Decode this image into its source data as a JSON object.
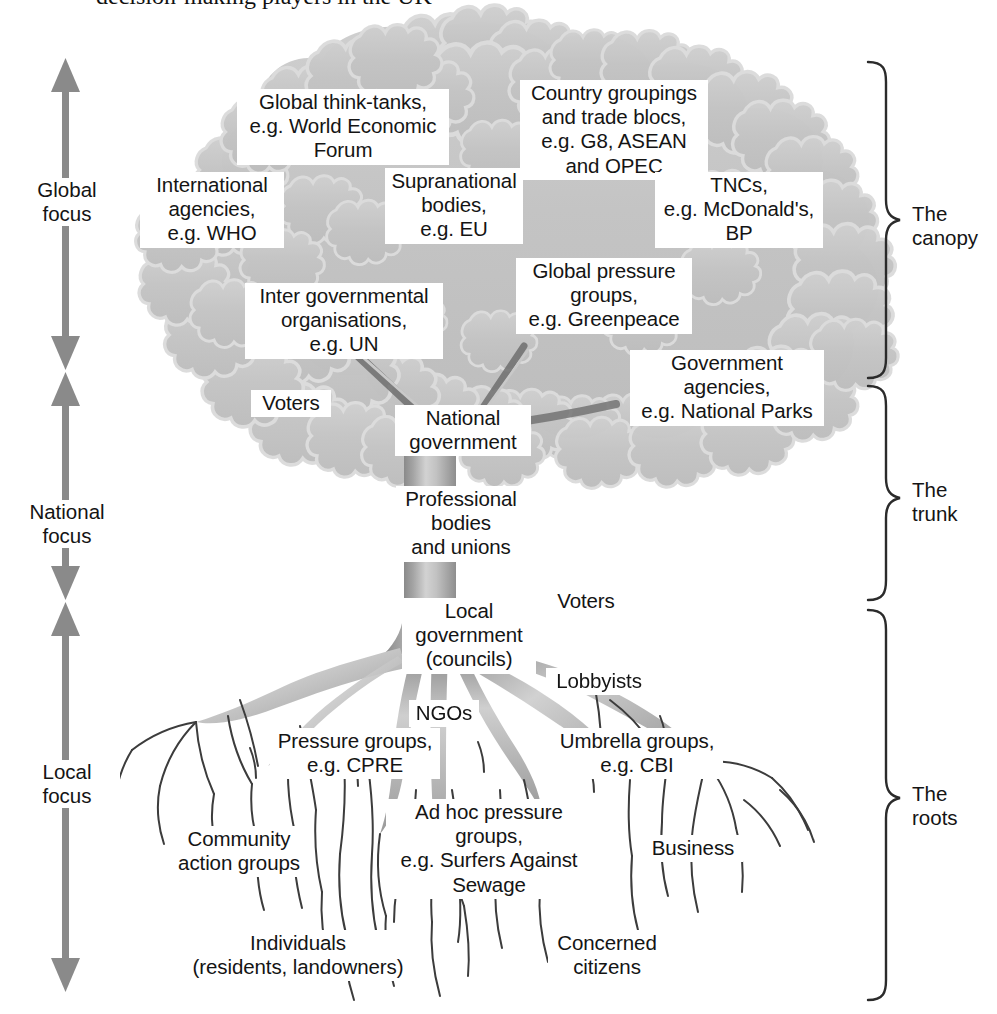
{
  "figure": {
    "title_fragment": "decision-making players in the UK",
    "type": "tree-diagram"
  },
  "colors": {
    "canopy_fill": "#c6c6c6",
    "canopy_edge": "#d8d8d8",
    "trunk_dark": "#8e8e8e",
    "trunk_light": "#d4d4d4",
    "root_line": "#3a3a3a",
    "arrow": "#8a8a8a",
    "bracket": "#2b2b2b",
    "text": "#141414",
    "label_bg": "#ffffff"
  },
  "axis": {
    "name": "focus-scale",
    "segments": [
      {
        "id": "global",
        "label": "Global\nfocus",
        "label_top": 178,
        "arrow_top": 60,
        "arrow_bottom": 370
      },
      {
        "id": "national",
        "label": "National\nfocus",
        "label_top": 500,
        "arrow_top": 372,
        "arrow_bottom": 600
      },
      {
        "id": "local",
        "label": "Local\nfocus",
        "label_top": 760,
        "arrow_top": 602,
        "arrow_bottom": 992
      }
    ]
  },
  "brackets": [
    {
      "id": "canopy",
      "label": "The\ncanopy",
      "top": 62,
      "bottom": 378,
      "label_top": 202
    },
    {
      "id": "trunk",
      "label": "The\ntrunk",
      "top": 386,
      "bottom": 600,
      "label_top": 478
    },
    {
      "id": "roots",
      "label": "The\nroots",
      "top": 610,
      "bottom": 1000,
      "label_top": 782
    }
  ],
  "canopy_labels": [
    {
      "id": "global-think-tanks",
      "text": "Global think-tanks,\ne.g. World Economic\nForum",
      "left": 237,
      "top": 89,
      "width": 204
    },
    {
      "id": "country-groupings",
      "text": "Country groupings\nand trade blocs,\ne.g. G8, ASEAN\nand OPEC",
      "left": 520,
      "top": 80,
      "width": 180
    },
    {
      "id": "international-agencies",
      "text": "International\nagencies,\ne.g. WHO",
      "left": 140,
      "top": 172,
      "width": 136
    },
    {
      "id": "supranational-bodies",
      "text": "Supranational\nbodies,\ne.g. EU",
      "left": 385,
      "top": 168,
      "width": 130
    },
    {
      "id": "tncs",
      "text": "TNCs,\ne.g. McDonald's,\nBP",
      "left": 655,
      "top": 172,
      "width": 160
    },
    {
      "id": "global-pressure-groups",
      "text": "Global pressure\ngroups,\ne.g. Greenpeace",
      "left": 516,
      "top": 258,
      "width": 168
    },
    {
      "id": "inter-governmental",
      "text": "Inter governmental\norganisations,\ne.g. UN",
      "left": 245,
      "top": 283,
      "width": 190
    },
    {
      "id": "government-agencies",
      "text": "Government\nagencies,\ne.g. National Parks",
      "left": 630,
      "top": 350,
      "width": 186
    },
    {
      "id": "voters-canopy",
      "text": "Voters",
      "left": 251,
      "top": 390,
      "width": 72
    }
  ],
  "trunk_labels": [
    {
      "id": "national-government",
      "text": "National\ngovernment",
      "left": 395,
      "top": 405,
      "width": 128
    },
    {
      "id": "professional-bodies",
      "text": "Professional\nbodies\nand unions",
      "left": 396,
      "top": 486,
      "width": 122
    },
    {
      "id": "local-government",
      "text": "Local\ngovernment\n(councils)",
      "left": 402,
      "top": 598,
      "width": 126
    }
  ],
  "root_labels": [
    {
      "id": "voters-roots",
      "text": "Voters",
      "left": 546,
      "top": 588,
      "width": 72
    },
    {
      "id": "lobbyists",
      "text": "Lobbyists",
      "left": 546,
      "top": 668,
      "width": 98
    },
    {
      "id": "ngos",
      "text": "NGOs",
      "left": 409,
      "top": 700,
      "width": 62
    },
    {
      "id": "pressure-groups",
      "text": "Pressure groups,\ne.g. CPRE",
      "left": 270,
      "top": 728,
      "width": 162
    },
    {
      "id": "umbrella-groups",
      "text": "Umbrella groups,\ne.g. CBI",
      "left": 551,
      "top": 728,
      "width": 164
    },
    {
      "id": "ad-hoc-pressure",
      "text": "Ad hoc pressure\ngroups,\ne.g. Surfers Against\nSewage",
      "left": 386,
      "top": 799,
      "width": 198
    },
    {
      "id": "community-action",
      "text": "Community\naction groups",
      "left": 166,
      "top": 826,
      "width": 138
    },
    {
      "id": "business",
      "text": "Business",
      "left": 643,
      "top": 835,
      "width": 92
    },
    {
      "id": "individuals",
      "text": "Individuals\n(residents, landowners)",
      "left": 180,
      "top": 930,
      "width": 228
    },
    {
      "id": "concerned-citizens",
      "text": "Concerned\ncitizens",
      "left": 548,
      "top": 930,
      "width": 110
    }
  ]
}
